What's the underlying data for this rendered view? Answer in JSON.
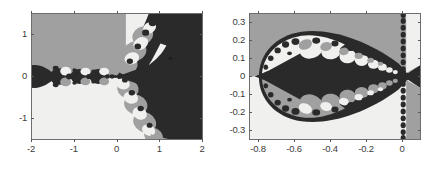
{
  "figure": {
    "width": 434,
    "height": 171,
    "background": "#ffffff",
    "panel_count": 2
  },
  "colors": {
    "basin_dark": "#2a2a2a",
    "basin_mid": "#a0a0a0",
    "basin_light": "#f0f0ee",
    "axis_line": "#6e6e6e",
    "tick_label": "#3c3c3c",
    "page_background": "#ffffff"
  },
  "chart_data": [
    {
      "type": "heatmap",
      "name": "left-panel",
      "title": "",
      "subtitle": "",
      "xlabel": "",
      "ylabel": "",
      "xlim": [
        -2,
        2
      ],
      "ylim": [
        -1.5,
        1.5
      ],
      "xticks": [
        -2,
        -1,
        0,
        1,
        2
      ],
      "xticklabels": [
        "-2",
        "-1",
        "0",
        "1",
        "2"
      ],
      "yticks": [
        -1,
        0,
        1
      ],
      "yticklabels": [
        "-1",
        "0",
        "1"
      ],
      "grid": false,
      "legend": null,
      "colormap": [
        "#2a2a2a",
        "#a0a0a0",
        "#f0f0ee"
      ],
      "levels": 3,
      "description": "Basin-of-attraction fractal: upper-left half medium gray, lower-left half light gray, right region dark, with a chain of dark bulbs along the negative real axis and interlocking circular bulbs near x in [0.3, 1].",
      "regions": [
        {
          "fill": "basin_mid",
          "where": "upper-left quadrant, x<0.1 and y>0"
        },
        {
          "fill": "basin_light",
          "where": "lower-left quadrant, x<0.1 and y<0"
        },
        {
          "fill": "basin_dark",
          "where": "right half, x>0.6"
        },
        {
          "fill": "basin_dark",
          "where": "bulb chain along real axis from x=-2 to x=0"
        }
      ]
    },
    {
      "type": "heatmap",
      "name": "right-panel",
      "title": "",
      "subtitle": "",
      "xlabel": "",
      "ylabel": "",
      "xlim": [
        -0.85,
        0.1
      ],
      "ylim": [
        -0.35,
        0.35
      ],
      "xticks": [
        -0.8,
        -0.6,
        -0.4,
        -0.2,
        0
      ],
      "xticklabels": [
        "-0.8",
        "-0.6",
        "-0.4",
        "-0.2",
        "0"
      ],
      "yticks": [
        -0.3,
        -0.2,
        -0.1,
        0,
        0.1,
        0.2,
        0.3
      ],
      "yticklabels": [
        "-0.3",
        "-0.2",
        "-0.1",
        "0",
        "0.1",
        "0.2",
        "0.3"
      ],
      "grid": false,
      "legend": null,
      "colormap": [
        "#2a2a2a",
        "#a0a0a0",
        "#f0f0ee"
      ],
      "levels": 3,
      "description": "Zoomed detail: large dark lens/diamond spanning x=-0.78 to 0, bordered by a ring of alternating light and mid-gray circular bulbs; medium gray above the axis, light gray below; a vertical dotted chain of bulbs at x=0 with a dark wedge opening to the right.",
      "regions": [
        {
          "fill": "basin_mid",
          "where": "upper half background"
        },
        {
          "fill": "basin_light",
          "where": "lower half background"
        },
        {
          "fill": "basin_dark",
          "where": "central lens from x=-0.78 to x=0"
        },
        {
          "fill": "basin_dark",
          "where": "wedge right of x=0"
        }
      ]
    }
  ],
  "panels": [
    {
      "id": "left-panel",
      "frame": {
        "left": 31,
        "top": 13,
        "width": 172,
        "height": 127
      },
      "xticks": [
        {
          "label": "-2",
          "pos": 0.0
        },
        {
          "label": "-1",
          "pos": 0.25
        },
        {
          "label": "0",
          "pos": 0.5
        },
        {
          "label": "1",
          "pos": 0.75
        },
        {
          "label": "2",
          "pos": 1.0
        }
      ],
      "yticks": [
        {
          "label": "1",
          "pos": 0.1667
        },
        {
          "label": "0",
          "pos": 0.5
        },
        {
          "label": "-1",
          "pos": 0.8333
        }
      ]
    },
    {
      "id": "right-panel",
      "frame": {
        "left": 249,
        "top": 13,
        "width": 172,
        "height": 127
      },
      "xticks": [
        {
          "label": "-0.8",
          "pos": 0.0526
        },
        {
          "label": "-0.6",
          "pos": 0.2632
        },
        {
          "label": "-0.4",
          "pos": 0.4737
        },
        {
          "label": "-0.2",
          "pos": 0.6842
        },
        {
          "label": "0",
          "pos": 0.8947
        }
      ],
      "yticks": [
        {
          "label": "0.3",
          "pos": 0.0714
        },
        {
          "label": "0.2",
          "pos": 0.2143
        },
        {
          "label": "0.1",
          "pos": 0.3571
        },
        {
          "label": "0",
          "pos": 0.5
        },
        {
          "label": "-0.1",
          "pos": 0.6429
        },
        {
          "label": "-0.2",
          "pos": 0.7857
        },
        {
          "label": "-0.3",
          "pos": 0.9286
        }
      ]
    }
  ]
}
